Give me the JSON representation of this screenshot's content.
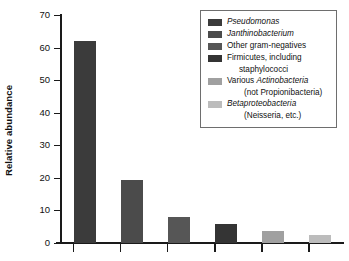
{
  "chart_data": {
    "type": "bar",
    "title": "",
    "xlabel": "",
    "ylabel": "Relative abundance",
    "ylim": [
      0,
      70
    ],
    "yticks": [
      0,
      10,
      20,
      30,
      40,
      50,
      60,
      70
    ],
    "grid": false,
    "legend_position": "top-right",
    "categories": [
      "Pseudomonas",
      "Janthinobacterium",
      "Other gram-negatives",
      "Firmicutes, including staphylococci",
      "Various Actinobacteria (not Propionibacteria)",
      "Betaproteobacteria (Neisseria, etc.)"
    ],
    "values": [
      62,
      19.5,
      8,
      5.8,
      3.6,
      2.4
    ],
    "colors": [
      "#3b3b3b",
      "#4b4b4b",
      "#565656",
      "#343434",
      "#a0a0a0",
      "#bcbcbc"
    ],
    "xtick_labels": [
      "",
      "",
      "",
      "",
      "",
      ""
    ]
  },
  "axis": {
    "y_title": "Relative abundance",
    "y_tick_labels": [
      "70",
      "60",
      "50",
      "40",
      "30",
      "20",
      "10",
      "0"
    ]
  },
  "legend": {
    "entries": [
      {
        "swatch_color": "#3b3b3b",
        "line1_pre": "",
        "line1_italic": "Pseudomonas",
        "line1_post": "",
        "line2": ""
      },
      {
        "swatch_color": "#4b4b4b",
        "line1_pre": "",
        "line1_italic": "Janthinobacterium",
        "line1_post": "",
        "line2": ""
      },
      {
        "swatch_color": "#565656",
        "line1_pre": "Other gram-negatives",
        "line1_italic": "",
        "line1_post": "",
        "line2": ""
      },
      {
        "swatch_color": "#343434",
        "line1_pre": "Firmicutes, including",
        "line1_italic": "",
        "line1_post": "",
        "line2": "staphylococci"
      },
      {
        "swatch_color": "#a0a0a0",
        "line1_pre": "Various ",
        "line1_italic": "Actinobacteria",
        "line1_post": "",
        "line2_pre": "(not ",
        "line2_italic": "Propionibacteria",
        "line2_post": ")"
      },
      {
        "swatch_color": "#bcbcbc",
        "line1_pre": "",
        "line1_italic": "Betaproteobacteria",
        "line1_post": "",
        "line2_pre": "(",
        "line2_italic": "Neisseria",
        "line2_post": ", etc.)"
      }
    ]
  }
}
